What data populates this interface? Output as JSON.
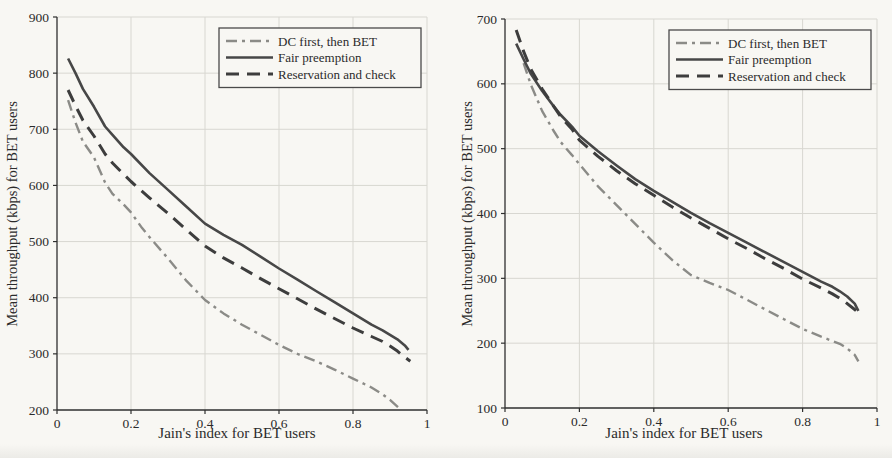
{
  "figure": {
    "background": "#f8f7f3",
    "grid_color": "#d8d7d1",
    "axis_color": "#2f2f2f",
    "legend_border_color": "#4a4a4a"
  },
  "chart_data": [
    {
      "id": "left",
      "type": "line",
      "title": "",
      "xlabel": "Jain's index for BET users",
      "ylabel": "Mean throughput (kbps) for BET users",
      "xlim": [
        0,
        1
      ],
      "ylim": [
        200,
        900
      ],
      "xticks": [
        0,
        0.2,
        0.4,
        0.6,
        0.8,
        1
      ],
      "yticks": [
        200,
        300,
        400,
        500,
        600,
        700,
        800,
        900
      ],
      "grid": true,
      "legend_position": "top-right",
      "series": [
        {
          "name": "DC first, then BET",
          "style": "dashdot",
          "color": "#8b8b87",
          "points": [
            [
              0.03,
              752
            ],
            [
              0.05,
              712
            ],
            [
              0.07,
              678
            ],
            [
              0.1,
              650
            ],
            [
              0.13,
              605
            ],
            [
              0.15,
              585
            ],
            [
              0.18,
              566
            ],
            [
              0.2,
              552
            ],
            [
              0.23,
              524
            ],
            [
              0.25,
              508
            ],
            [
              0.3,
              470
            ],
            [
              0.35,
              430
            ],
            [
              0.4,
              396
            ],
            [
              0.45,
              372
            ],
            [
              0.5,
              352
            ],
            [
              0.55,
              334
            ],
            [
              0.6,
              316
            ],
            [
              0.65,
              300
            ],
            [
              0.7,
              287
            ],
            [
              0.75,
              272
            ],
            [
              0.8,
              256
            ],
            [
              0.85,
              240
            ],
            [
              0.88,
              228
            ],
            [
              0.9,
              218
            ],
            [
              0.92,
              206
            ],
            [
              0.93,
              200
            ]
          ]
        },
        {
          "name": "Fair preemption",
          "style": "solid",
          "color": "#474747",
          "points": [
            [
              0.03,
              826
            ],
            [
              0.05,
              800
            ],
            [
              0.07,
              772
            ],
            [
              0.1,
              740
            ],
            [
              0.13,
              705
            ],
            [
              0.15,
              690
            ],
            [
              0.18,
              668
            ],
            [
              0.2,
              656
            ],
            [
              0.25,
              622
            ],
            [
              0.3,
              592
            ],
            [
              0.35,
              562
            ],
            [
              0.4,
              532
            ],
            [
              0.45,
              512
            ],
            [
              0.5,
              494
            ],
            [
              0.55,
              473
            ],
            [
              0.6,
              452
            ],
            [
              0.65,
              432
            ],
            [
              0.7,
              412
            ],
            [
              0.75,
              392
            ],
            [
              0.8,
              372
            ],
            [
              0.85,
              352
            ],
            [
              0.88,
              342
            ],
            [
              0.9,
              334
            ],
            [
              0.92,
              326
            ],
            [
              0.94,
              315
            ],
            [
              0.95,
              307
            ]
          ]
        },
        {
          "name": "Reservation and check",
          "style": "dashed",
          "color": "#3d3d3d",
          "points": [
            [
              0.03,
              770
            ],
            [
              0.05,
              742
            ],
            [
              0.07,
              716
            ],
            [
              0.1,
              688
            ],
            [
              0.13,
              656
            ],
            [
              0.15,
              640
            ],
            [
              0.18,
              620
            ],
            [
              0.2,
              607
            ],
            [
              0.25,
              578
            ],
            [
              0.3,
              550
            ],
            [
              0.35,
              521
            ],
            [
              0.4,
              492
            ],
            [
              0.45,
              471
            ],
            [
              0.5,
              453
            ],
            [
              0.55,
              434
            ],
            [
              0.6,
              416
            ],
            [
              0.65,
              398
            ],
            [
              0.7,
              380
            ],
            [
              0.75,
              363
            ],
            [
              0.8,
              346
            ],
            [
              0.85,
              331
            ],
            [
              0.88,
              322
            ],
            [
              0.9,
              314
            ],
            [
              0.92,
              305
            ],
            [
              0.94,
              294
            ],
            [
              0.955,
              287
            ]
          ]
        }
      ]
    },
    {
      "id": "right",
      "type": "line",
      "title": "",
      "xlabel": "Jain's index for BET users",
      "ylabel": "Mean throughput (kbps) for BET users",
      "xlim": [
        0,
        1
      ],
      "ylim": [
        100,
        700
      ],
      "xticks": [
        0,
        0.2,
        0.4,
        0.6,
        0.8,
        1
      ],
      "yticks": [
        100,
        200,
        300,
        400,
        500,
        600,
        700
      ],
      "grid": true,
      "legend_position": "top-right",
      "series": [
        {
          "name": "DC first, then BET",
          "style": "dashdot",
          "color": "#8b8b87",
          "points": [
            [
              0.05,
              632
            ],
            [
              0.07,
              598
            ],
            [
              0.1,
              558
            ],
            [
              0.13,
              528
            ],
            [
              0.15,
              510
            ],
            [
              0.18,
              490
            ],
            [
              0.2,
              476
            ],
            [
              0.25,
              442
            ],
            [
              0.3,
              413
            ],
            [
              0.35,
              384
            ],
            [
              0.4,
              355
            ],
            [
              0.45,
              328
            ],
            [
              0.5,
              305
            ],
            [
              0.55,
              293
            ],
            [
              0.6,
              282
            ],
            [
              0.65,
              267
            ],
            [
              0.7,
              252
            ],
            [
              0.75,
              237
            ],
            [
              0.8,
              222
            ],
            [
              0.85,
              210
            ],
            [
              0.9,
              199
            ],
            [
              0.92,
              192
            ],
            [
              0.94,
              182
            ],
            [
              0.95,
              172
            ]
          ]
        },
        {
          "name": "Fair preemption",
          "style": "solid",
          "color": "#474747",
          "points": [
            [
              0.03,
              662
            ],
            [
              0.05,
              638
            ],
            [
              0.07,
              615
            ],
            [
              0.1,
              589
            ],
            [
              0.13,
              566
            ],
            [
              0.15,
              552
            ],
            [
              0.18,
              534
            ],
            [
              0.2,
              520
            ],
            [
              0.25,
              496
            ],
            [
              0.3,
              474
            ],
            [
              0.35,
              453
            ],
            [
              0.4,
              435
            ],
            [
              0.45,
              418
            ],
            [
              0.5,
              401
            ],
            [
              0.55,
              385
            ],
            [
              0.6,
              370
            ],
            [
              0.65,
              355
            ],
            [
              0.7,
              340
            ],
            [
              0.75,
              325
            ],
            [
              0.8,
              310
            ],
            [
              0.85,
              295
            ],
            [
              0.88,
              287
            ],
            [
              0.9,
              280
            ],
            [
              0.92,
              272
            ],
            [
              0.94,
              261
            ],
            [
              0.95,
              250
            ]
          ]
        },
        {
          "name": "Reservation and check",
          "style": "dashed",
          "color": "#3d3d3d",
          "points": [
            [
              0.03,
              683
            ],
            [
              0.05,
              650
            ],
            [
              0.07,
              622
            ],
            [
              0.1,
              592
            ],
            [
              0.13,
              566
            ],
            [
              0.15,
              549
            ],
            [
              0.18,
              530
            ],
            [
              0.2,
              513
            ],
            [
              0.25,
              488
            ],
            [
              0.3,
              466
            ],
            [
              0.35,
              446
            ],
            [
              0.4,
              428
            ],
            [
              0.45,
              410
            ],
            [
              0.5,
              393
            ],
            [
              0.55,
              377
            ],
            [
              0.6,
              361
            ],
            [
              0.65,
              346
            ],
            [
              0.7,
              330
            ],
            [
              0.75,
              315
            ],
            [
              0.8,
              299
            ],
            [
              0.85,
              285
            ],
            [
              0.88,
              276
            ],
            [
              0.9,
              269
            ],
            [
              0.92,
              261
            ],
            [
              0.94,
              252
            ],
            [
              0.95,
              247
            ]
          ]
        }
      ]
    }
  ]
}
